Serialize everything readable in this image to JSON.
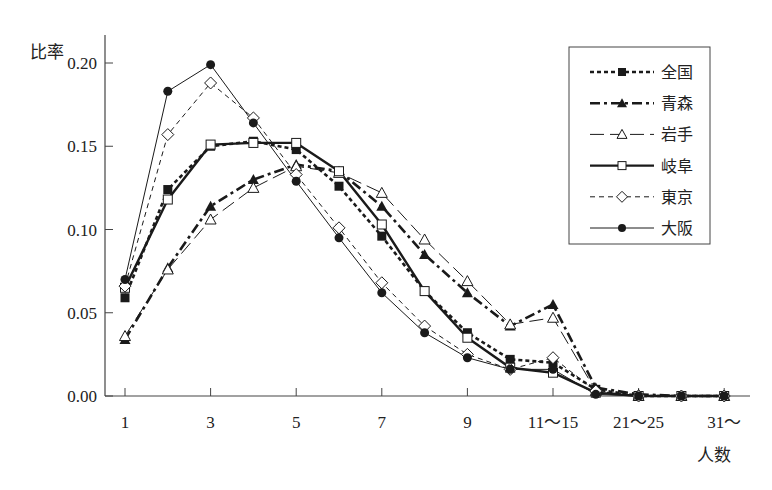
{
  "chart_data": {
    "type": "line",
    "title": "",
    "ylabel": "比率",
    "xlabel": "人数",
    "ylim": [
      0,
      0.2
    ],
    "yticks": [
      "0.00",
      "0.05",
      "0.10",
      "0.15",
      "0.20"
    ],
    "ytick_values": [
      0,
      0.05,
      0.1,
      0.15,
      0.2
    ],
    "categories": [
      "1",
      "2",
      "3",
      "4",
      "5",
      "6",
      "7",
      "8",
      "9",
      "10",
      "11~15",
      "16~20",
      "21~25",
      "26~30",
      "31~"
    ],
    "xtick_labels": [
      {
        "index": 0,
        "label": "1"
      },
      {
        "index": 2,
        "label": "3"
      },
      {
        "index": 4,
        "label": "5"
      },
      {
        "index": 6,
        "label": "7"
      },
      {
        "index": 8,
        "label": "9"
      },
      {
        "index": 10,
        "label": "11～15"
      },
      {
        "index": 12,
        "label": "21～25"
      },
      {
        "index": 14,
        "label": "31～"
      }
    ],
    "grid": false,
    "legend_position": "upper right (boxed)",
    "series": [
      {
        "name": "全国",
        "marker": "filled-square",
        "line": "dotted-thick",
        "values": [
          0.059,
          0.124,
          0.15,
          0.153,
          0.148,
          0.126,
          0.096,
          0.063,
          0.038,
          0.022,
          0.02,
          0.004,
          0.0,
          0.0,
          0.0
        ]
      },
      {
        "name": "青森",
        "marker": "filled-triangle",
        "line": "dash-dot-thick",
        "values": [
          0.034,
          0.077,
          0.114,
          0.13,
          0.139,
          0.135,
          0.114,
          0.085,
          0.062,
          0.042,
          0.055,
          0.005,
          0.001,
          0.0,
          0.0
        ]
      },
      {
        "name": "岩手",
        "marker": "open-triangle",
        "line": "long-dash-thin",
        "values": [
          0.036,
          0.076,
          0.106,
          0.125,
          0.138,
          0.134,
          0.122,
          0.094,
          0.069,
          0.043,
          0.047,
          0.003,
          0.0,
          0.0,
          0.0
        ]
      },
      {
        "name": "岐阜",
        "marker": "open-square",
        "line": "solid-thick",
        "values": [
          0.065,
          0.118,
          0.151,
          0.152,
          0.152,
          0.135,
          0.103,
          0.063,
          0.035,
          0.017,
          0.014,
          0.002,
          0.0,
          0.0,
          0.0
        ]
      },
      {
        "name": "東京",
        "marker": "open-diamond",
        "line": "dashed-thin",
        "values": [
          0.066,
          0.157,
          0.188,
          0.167,
          0.133,
          0.101,
          0.068,
          0.042,
          0.025,
          0.016,
          0.023,
          0.003,
          0.0,
          0.0,
          0.0
        ]
      },
      {
        "name": "大阪",
        "marker": "filled-circle",
        "line": "solid-thin",
        "values": [
          0.07,
          0.183,
          0.199,
          0.164,
          0.129,
          0.095,
          0.062,
          0.038,
          0.023,
          0.016,
          0.016,
          0.001,
          0.0,
          0.0,
          0.0
        ]
      }
    ]
  },
  "colors": {
    "line": "#1a1a1a",
    "axis": "#444444",
    "background": "#ffffff"
  }
}
